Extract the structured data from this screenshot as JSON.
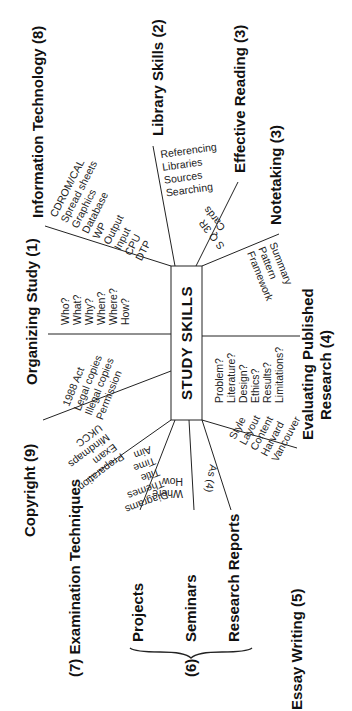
{
  "center": {
    "label": "STUDY SKILLS"
  },
  "branches": {
    "information_technology": {
      "label": "Information Technology (8)",
      "items": [
        "CDROM/CAL",
        "Spread sheets",
        "Graphics",
        "Database",
        "WP",
        "Output",
        "Input",
        "CPU",
        "DTP"
      ]
    },
    "library_skills": {
      "label": "Library Skills (2)",
      "items": [
        "Referencing",
        "Libraries",
        "Sources",
        "Searching"
      ]
    },
    "effective_reading": {
      "label": "Effective Reading (3)",
      "items": [
        "S Q 3R",
        "Cards"
      ]
    },
    "notetaking": {
      "label": "Notetaking (3)",
      "items": [
        "Framework",
        "Pattern",
        "Summary"
      ]
    },
    "organizing_study": {
      "label": "Organizing Study (1)",
      "items": [
        "Who?",
        "What?",
        "Why?",
        "When?",
        "Where?",
        "How?"
      ]
    },
    "evaluating_research": {
      "label_line1": "Evaluating Published",
      "label_line2": "Research (4)",
      "items": [
        "Problem?",
        "Literature?",
        "Design?",
        "Ethics?",
        "Results?",
        "Limitations?"
      ]
    },
    "copyright": {
      "label": "Copyright (9)",
      "items": [
        "1988 Act",
        "Legal copies",
        "Illegal copies",
        "Permission"
      ]
    },
    "examination_techniques": {
      "label": "(7) Examination Techniques",
      "items": [
        "UKCC",
        "Mindmaps",
        "Exam",
        "Preparation"
      ]
    },
    "projects_seminars_reports": {
      "group_number": "(6)",
      "projects_label": "Projects",
      "seminars_label": "Seminars",
      "reports_label": "Research Reports",
      "projects_items": [
        "Aim",
        "Time",
        "Title",
        "Themes",
        "Diagrams"
      ],
      "seminars_items": [
        "How",
        "Where"
      ],
      "reports_items": [
        "As (4)"
      ]
    },
    "essay_writing": {
      "label": "Essay Writing (5)",
      "items": [
        "Style",
        "Layout",
        "Content",
        "Harvard",
        "Vancouver"
      ]
    }
  }
}
